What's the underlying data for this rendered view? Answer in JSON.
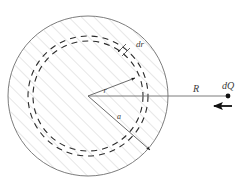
{
  "figure": {
    "background_color": "#ffffff",
    "labels": {
      "inner_radius_vector": "r",
      "shell_thickness": "dr",
      "sphere_radius_inner": "a",
      "distance_to_charge": "R",
      "point_charge": "dQ"
    },
    "colors": {
      "outline": "#6e6e6e",
      "hatch": "#c9c9c9",
      "dashed": "#2b2b2b",
      "vector": "#5a5a5a",
      "text": "#3b3b3b",
      "charge_dot": "#111111",
      "force_arrow": "#111111"
    },
    "geometry": {
      "center_x": 88,
      "center_y": 96,
      "outer_radius": 80,
      "dashed_radius_inner": 55,
      "dashed_radius_outer": 60,
      "charge_x": 228,
      "charge_y": 96
    },
    "annotations": {
      "hatch_pattern": "diagonal-lines-45deg",
      "dashed_circle_count": 2,
      "force_arrow_direction": "left"
    }
  }
}
